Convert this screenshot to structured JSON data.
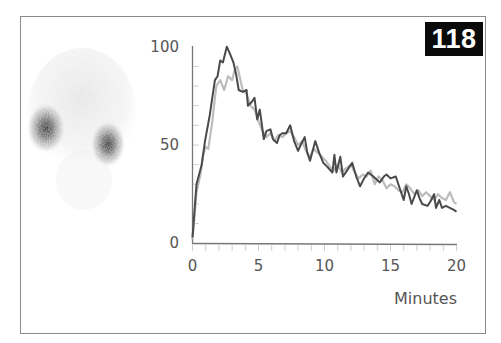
{
  "figure": {
    "badge_number": "118",
    "scan_image": {
      "description": "grayscale renal scintigraphy scan showing two kidneys"
    }
  },
  "chart_data": {
    "type": "line",
    "title": "",
    "xlabel": "Minutes",
    "ylabel": "",
    "xlim": [
      0,
      20
    ],
    "ylim": [
      0,
      100
    ],
    "x_ticks": [
      0,
      5,
      10,
      15,
      20
    ],
    "y_ticks": [
      0,
      50,
      100
    ],
    "x_minor_tick_step": 1,
    "grid": false,
    "legend": null,
    "series": [
      {
        "name": "Dark curve",
        "color": "#4a4a4a",
        "points": [
          [
            0,
            3
          ],
          [
            0.3,
            30
          ],
          [
            0.7,
            40
          ],
          [
            0.95,
            52
          ],
          [
            1.3,
            65
          ],
          [
            1.7,
            83
          ],
          [
            1.9,
            85
          ],
          [
            2.1,
            93
          ],
          [
            2.3,
            92
          ],
          [
            2.6,
            100
          ],
          [
            2.8,
            97
          ],
          [
            3.1,
            92
          ],
          [
            3.3,
            86
          ],
          [
            3.5,
            78
          ],
          [
            3.8,
            77
          ],
          [
            4.1,
            78
          ],
          [
            4.2,
            70
          ],
          [
            4.5,
            72
          ],
          [
            4.7,
            74
          ],
          [
            4.9,
            63
          ],
          [
            5.1,
            68
          ],
          [
            5.4,
            53
          ],
          [
            5.6,
            57
          ],
          [
            5.9,
            58
          ],
          [
            6.1,
            53
          ],
          [
            6.4,
            51
          ],
          [
            6.6,
            55
          ],
          [
            6.8,
            56
          ],
          [
            7.1,
            56
          ],
          [
            7.4,
            60
          ],
          [
            7.7,
            52
          ],
          [
            8.0,
            47
          ],
          [
            8.2,
            50
          ],
          [
            8.5,
            54
          ],
          [
            8.7,
            46
          ],
          [
            8.9,
            42
          ],
          [
            9.3,
            52
          ],
          [
            9.6,
            46
          ],
          [
            9.9,
            41
          ],
          [
            10.2,
            39
          ],
          [
            10.6,
            36
          ],
          [
            10.75,
            45
          ],
          [
            10.9,
            36
          ],
          [
            11.2,
            44
          ],
          [
            11.4,
            34
          ],
          [
            11.8,
            38
          ],
          [
            12.1,
            41
          ],
          [
            12.4,
            34
          ],
          [
            12.7,
            29
          ],
          [
            13.0,
            33
          ],
          [
            13.3,
            36
          ],
          [
            13.7,
            34
          ],
          [
            14.2,
            31
          ],
          [
            14.5,
            34
          ],
          [
            14.7,
            35
          ],
          [
            15.0,
            33
          ],
          [
            15.4,
            34
          ],
          [
            15.7,
            28
          ],
          [
            16.0,
            22
          ],
          [
            16.2,
            29
          ],
          [
            16.4,
            25
          ],
          [
            16.6,
            20
          ],
          [
            17.0,
            27
          ],
          [
            17.2,
            23
          ],
          [
            17.4,
            20
          ],
          [
            17.8,
            19
          ],
          [
            18.0,
            21
          ],
          [
            18.3,
            25
          ],
          [
            18.45,
            18
          ],
          [
            18.7,
            22
          ],
          [
            18.9,
            18
          ],
          [
            19.2,
            19
          ],
          [
            19.5,
            18
          ],
          [
            19.8,
            17
          ],
          [
            20.0,
            16
          ]
        ]
      },
      {
        "name": "Light curve",
        "color": "#bdbdbd",
        "points": [
          [
            0,
            2
          ],
          [
            0.3,
            26
          ],
          [
            0.6,
            35
          ],
          [
            0.8,
            45
          ],
          [
            1.0,
            49
          ],
          [
            1.2,
            48
          ],
          [
            1.5,
            62
          ],
          [
            1.8,
            80
          ],
          [
            2.1,
            83
          ],
          [
            2.4,
            78
          ],
          [
            2.7,
            85
          ],
          [
            3.0,
            83
          ],
          [
            3.2,
            88
          ],
          [
            3.4,
            90
          ],
          [
            3.6,
            84
          ],
          [
            3.8,
            78
          ],
          [
            4.1,
            76
          ],
          [
            4.4,
            70
          ],
          [
            4.7,
            68
          ],
          [
            5.0,
            62
          ],
          [
            5.3,
            57
          ],
          [
            5.6,
            54
          ],
          [
            5.9,
            56
          ],
          [
            6.2,
            52
          ],
          [
            6.5,
            55
          ],
          [
            6.8,
            54
          ],
          [
            7.1,
            56
          ],
          [
            7.4,
            57
          ],
          [
            7.7,
            54
          ],
          [
            8.0,
            50
          ],
          [
            8.3,
            52
          ],
          [
            8.6,
            47
          ],
          [
            8.9,
            44
          ],
          [
            9.2,
            48
          ],
          [
            9.5,
            46
          ],
          [
            9.8,
            44
          ],
          [
            10.1,
            42
          ],
          [
            10.4,
            39
          ],
          [
            10.7,
            37
          ],
          [
            11.0,
            40
          ],
          [
            11.3,
            36
          ],
          [
            11.6,
            38
          ],
          [
            12.0,
            40
          ],
          [
            12.3,
            36
          ],
          [
            12.6,
            33
          ],
          [
            12.9,
            35
          ],
          [
            13.2,
            34
          ],
          [
            13.5,
            37
          ],
          [
            13.8,
            30
          ],
          [
            14.1,
            34
          ],
          [
            14.4,
            32
          ],
          [
            14.7,
            28
          ],
          [
            15.0,
            30
          ],
          [
            15.3,
            29
          ],
          [
            15.6,
            27
          ],
          [
            15.9,
            26
          ],
          [
            16.2,
            30
          ],
          [
            16.5,
            28
          ],
          [
            16.8,
            25
          ],
          [
            17.1,
            27
          ],
          [
            17.4,
            24
          ],
          [
            17.7,
            26
          ],
          [
            18.0,
            24
          ],
          [
            18.3,
            22
          ],
          [
            18.6,
            25
          ],
          [
            18.9,
            23
          ],
          [
            19.2,
            22
          ],
          [
            19.5,
            26
          ],
          [
            19.8,
            21
          ],
          [
            20.0,
            20
          ]
        ]
      }
    ]
  }
}
